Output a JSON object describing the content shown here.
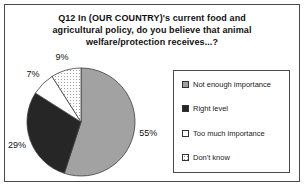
{
  "title": {
    "lines": [
      "Q12 In (OUR COUNTRY)'s current food and",
      "agricultural policy, do you believe that animal",
      "welfare/protection receives...?"
    ]
  },
  "legend": {
    "items": [
      {
        "label": "Not enough importance",
        "color": "#a2a2a2"
      },
      {
        "label": "Right level",
        "color": "#262626"
      },
      {
        "label": "Too much importance",
        "color": "#ffffff"
      },
      {
        "label": "Don't know",
        "color": "dots"
      }
    ]
  },
  "chart_data": {
    "type": "pie",
    "title": "Q12 In (OUR COUNTRY)'s current food and agricultural policy, do you believe that animal welfare/protection receives...?",
    "categories": [
      "Not enough importance",
      "Right level",
      "Too much importance",
      "Don't know"
    ],
    "values": [
      55,
      29,
      7,
      9
    ],
    "labels": [
      "55%",
      "29%",
      "7%",
      "9%"
    ],
    "colors": [
      "#a2a2a2",
      "#262626",
      "#ffffff",
      "dots"
    ],
    "start_angle": "top",
    "direction": "clockwise",
    "legend_position": "right",
    "outline_color": "#404040"
  }
}
